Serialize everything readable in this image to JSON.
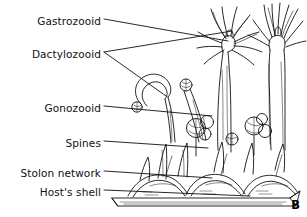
{
  "figure": {
    "panel_label": "B",
    "ink_color": "#111111",
    "background_color": "#ffffff"
  },
  "labels": [
    {
      "id": "gastrozooid",
      "text": "Gastrozooid",
      "text_x": 101,
      "text_y": 21,
      "line_x1": 104,
      "line_y1": 19,
      "line_x2": 228,
      "line_y2": 41
    },
    {
      "id": "dactylozooid",
      "text": "Dactylozooid",
      "text_x": 101,
      "text_y": 54,
      "line_x1": 104,
      "line_y1": 52,
      "line_x2": 232,
      "line_y2": 31
    },
    {
      "id": "dactylozooid_b",
      "text": "",
      "text_x": 0,
      "text_y": 0,
      "line_x1": 104,
      "line_y1": 52,
      "line_x2": 166,
      "line_y2": 96
    },
    {
      "id": "gonozooid",
      "text": "Gonozooid",
      "text_x": 101,
      "text_y": 108,
      "line_x1": 104,
      "line_y1": 106,
      "line_x2": 212,
      "line_y2": 116
    },
    {
      "id": "spines",
      "text": "Spines",
      "text_x": 101,
      "text_y": 143,
      "line_x1": 104,
      "line_y1": 141,
      "line_x2": 208,
      "line_y2": 148
    },
    {
      "id": "stolon_network",
      "text": "Stolon network",
      "text_x": 101,
      "text_y": 173,
      "line_x1": 104,
      "line_y1": 171,
      "line_x2": 212,
      "line_y2": 178
    },
    {
      "id": "hosts_shell",
      "text": "Host's shell",
      "text_x": 101,
      "text_y": 192,
      "line_x1": 104,
      "line_y1": 190,
      "line_x2": 250,
      "line_y2": 196
    }
  ]
}
